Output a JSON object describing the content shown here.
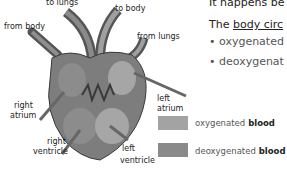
{
  "diagram": {
    "labels": {
      "to_lungs": "to lungs",
      "to_body": "to body",
      "from_body": "from body",
      "from_lungs": "from lungs",
      "right_atrium_1": "right",
      "right_atrium_2": "atrium",
      "left_atrium_1": "left",
      "left_atrium_2": "atrium",
      "right_ventricle_1": "right",
      "right_ventricle_2": "ventricle",
      "left_ventricle_1": "left",
      "left_ventricle_2": "ventricle"
    },
    "legend": [
      {
        "label_a": "oxygenated",
        "label_b": " blood",
        "color": "#a3a3a3"
      },
      {
        "label_a": "deoxygenated",
        "label_b": " blood",
        "color": "#8a8a8a"
      }
    ]
  },
  "text": {
    "line1": "It happens be",
    "line2_prefix": "The ",
    "line2_underlined": "body circ",
    "bullet1": "• oxygenated",
    "bullet2": "• deoxygenat"
  },
  "colors": {
    "heart_outer": "#7d7d7d",
    "heart_inner_light": "#9e9e9e",
    "vessel_dark": "#555555"
  }
}
